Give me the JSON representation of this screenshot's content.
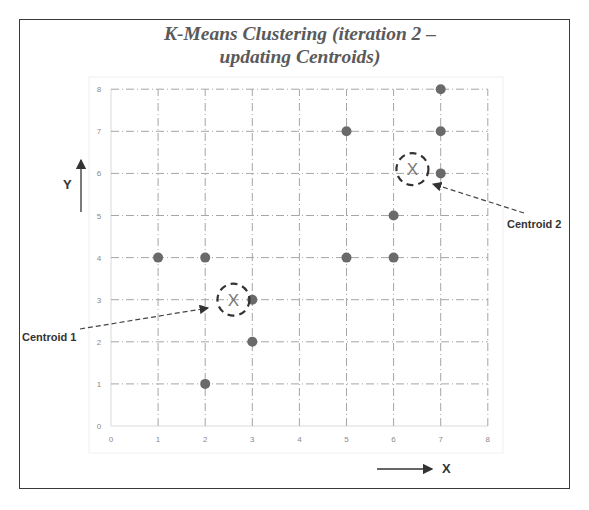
{
  "chart_data": {
    "type": "scatter",
    "title": "K-Means Clustering (iteration 2 – updating Centroids)",
    "title_lines": [
      "K-Means Clustering (iteration 2 –",
      "updating Centroids)"
    ],
    "xlabel": "X",
    "ylabel": "Y",
    "xlim": [
      0,
      8
    ],
    "ylim": [
      0,
      8
    ],
    "x_ticks": [
      0,
      1,
      2,
      3,
      4,
      5,
      6,
      7,
      8
    ],
    "y_ticks": [
      0,
      1,
      2,
      3,
      4,
      5,
      6,
      7,
      8
    ],
    "grid": true,
    "legend": null,
    "series": [
      {
        "name": "points",
        "color": "#6a6a6a",
        "points": [
          {
            "x": 1,
            "y": 4
          },
          {
            "x": 2,
            "y": 4
          },
          {
            "x": 3,
            "y": 3
          },
          {
            "x": 3,
            "y": 2
          },
          {
            "x": 2,
            "y": 1
          },
          {
            "x": 5,
            "y": 7
          },
          {
            "x": 6,
            "y": 5
          },
          {
            "x": 5,
            "y": 4
          },
          {
            "x": 6,
            "y": 4
          },
          {
            "x": 7,
            "y": 8
          },
          {
            "x": 7,
            "y": 7
          },
          {
            "x": 7,
            "y": 6
          }
        ]
      },
      {
        "name": "centroids",
        "marker": "X",
        "points": [
          {
            "x": 2.6,
            "y": 3.0,
            "label": "Centroid 1"
          },
          {
            "x": 6.4,
            "y": 6.1,
            "label": "Centroid 2"
          }
        ]
      }
    ],
    "annotations": [
      "Centroid 1",
      "Centroid 2"
    ]
  },
  "labels": {
    "centroid1": "Centroid 1",
    "centroid2": "Centroid 2",
    "x_axis": "X",
    "y_axis": "Y",
    "centroid_marker": "X"
  }
}
